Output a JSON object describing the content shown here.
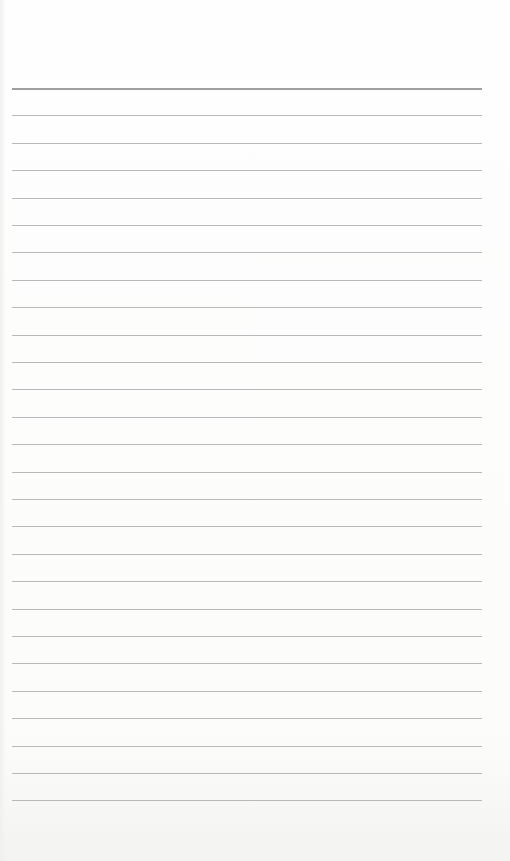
{
  "document": {
    "type": "lined-paper",
    "line_count": 27,
    "first_line_y": 88,
    "line_spacing": 27.4,
    "line_left": 12,
    "line_width": 470,
    "line_color": "#b9b9b9",
    "header_line_color": "#9f9f9f",
    "paper_color": "#fdfdfc",
    "text": []
  }
}
